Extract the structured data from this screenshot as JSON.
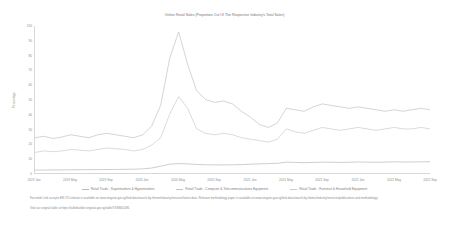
{
  "chart_data": {
    "type": "line",
    "title": "Online Retail Sales (Proportion Out Of The Respective Industry's Total Sales)",
    "xlabel": "",
    "ylabel": "Percentage",
    "ylim": [
      0,
      100
    ],
    "ytick_values": [
      0,
      10,
      20,
      30,
      40,
      50,
      60,
      70,
      80,
      90,
      100
    ],
    "grid": false,
    "legend_position": "bottom",
    "x_tick_labels": [
      "2019 Jan",
      "2019 May",
      "2019 Sep",
      "2020 Jan",
      "2020 May",
      "2020 Sep",
      "2021 Jan",
      "2021 May",
      "2021 Sep",
      "2022 Jan",
      "2022 May",
      "2022 Sep"
    ],
    "x": [
      "2019 Jan",
      "2019 Feb",
      "2019 Mar",
      "2019 Apr",
      "2019 May",
      "2019 Jun",
      "2019 Jul",
      "2019 Aug",
      "2019 Sep",
      "2019 Oct",
      "2019 Nov",
      "2019 Dec",
      "2020 Jan",
      "2020 Feb",
      "2020 Mar",
      "2020 Apr",
      "2020 May",
      "2020 Jun",
      "2020 Jul",
      "2020 Aug",
      "2020 Sep",
      "2020 Oct",
      "2020 Nov",
      "2020 Dec",
      "2021 Jan",
      "2021 Feb",
      "2021 Mar",
      "2021 Apr",
      "2021 May",
      "2021 Jun",
      "2021 Jul",
      "2021 Aug",
      "2021 Sep",
      "2021 Oct",
      "2021 Nov",
      "2021 Dec",
      "2022 Jan",
      "2022 Feb",
      "2022 Mar",
      "2022 Apr",
      "2022 May",
      "2022 Jun",
      "2022 Jul",
      "2022 Aug",
      "2022 Sep"
    ],
    "series": [
      {
        "name": "Retail Trade - Supermarkets & Hypermarkets",
        "color": "#b9b9b9",
        "values": [
          2.0,
          2.0,
          2.1,
          2.1,
          2.2,
          2.2,
          2.3,
          2.3,
          2.4,
          2.4,
          2.5,
          2.6,
          2.8,
          3.4,
          4.6,
          6.0,
          6.4,
          6.2,
          5.8,
          5.6,
          5.5,
          5.5,
          5.6,
          5.7,
          6.0,
          6.2,
          6.4,
          6.6,
          7.4,
          7.2,
          7.0,
          7.2,
          7.4,
          7.3,
          7.2,
          7.3,
          7.5,
          7.4,
          7.3,
          7.4,
          7.6,
          7.5,
          7.5,
          7.6,
          7.7
        ]
      },
      {
        "name": "Retail Trade - Computer & Telecommunications Equipment",
        "color": "#c2c2c2",
        "values": [
          24.0,
          25.0,
          23.5,
          24.5,
          26.0,
          25.0,
          24.0,
          26.0,
          27.0,
          26.0,
          25.0,
          24.0,
          26.0,
          32.0,
          46.0,
          78.0,
          96.0,
          74.0,
          56.0,
          50.0,
          48.0,
          49.0,
          47.0,
          42.0,
          38.0,
          33.0,
          31.0,
          34.0,
          44.0,
          43.0,
          42.0,
          45.0,
          47.0,
          46.0,
          45.0,
          44.0,
          45.0,
          44.0,
          43.0,
          42.0,
          43.0,
          42.0,
          43.0,
          44.0,
          43.0
        ]
      },
      {
        "name": "Retail Trade - Furniture & Household Equipment",
        "color": "#cccccc",
        "values": [
          14.0,
          15.0,
          14.5,
          15.0,
          16.0,
          15.5,
          15.0,
          16.0,
          17.0,
          16.5,
          16.0,
          15.0,
          16.0,
          19.0,
          24.0,
          40.0,
          52.0,
          44.0,
          30.0,
          27.0,
          26.0,
          27.0,
          26.0,
          24.0,
          23.0,
          22.0,
          21.0,
          23.0,
          30.0,
          28.0,
          27.0,
          29.0,
          31.0,
          30.0,
          29.0,
          30.0,
          31.0,
          30.0,
          29.0,
          30.0,
          31.0,
          30.0,
          30.0,
          31.0,
          30.0
        ]
      }
    ]
  },
  "footnotes": {
    "source_note": "Facsimile Link accepts EN-ITU release is available on www.singstat.gov.sg/find-data/search-by-theme/industry/services/latest-data. Relevant methodology paper is available on www.singstat.gov.sg/find-data/search-by-theme/industry/services/publications-and-methodology",
    "visualisation_note": "Visit our original table at https://tablebuilder.singstat.gov.sg/table/TS/M601481"
  }
}
